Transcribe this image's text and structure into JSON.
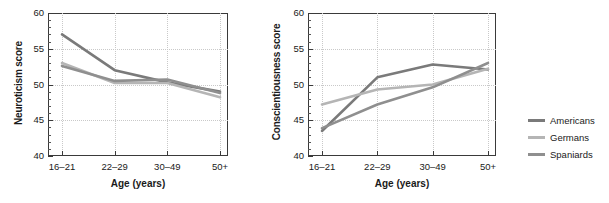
{
  "figure": {
    "background": "#ffffff",
    "legend": {
      "position": "right",
      "entries": [
        {
          "label": "Americans",
          "color": "#7a7a7a"
        },
        {
          "label": "Germans",
          "color": "#b5b5b5"
        },
        {
          "label": "Spaniards",
          "color": "#8f8f8f"
        }
      ]
    }
  },
  "chart_data": [
    {
      "id": "neuroticism",
      "type": "line",
      "title": "",
      "xlabel": "Age (years)",
      "ylabel": "Neuroticism score",
      "categories": [
        "16–21",
        "22–29",
        "30–49",
        "50+"
      ],
      "ylim": [
        40,
        60
      ],
      "yticks": [
        40,
        45,
        50,
        55,
        60
      ],
      "yticklabels": [
        "40",
        "45",
        "50",
        "55",
        "60"
      ],
      "grid": true,
      "series": [
        {
          "name": "Americans",
          "color": "#7a7a7a",
          "values": [
            57.0,
            52.0,
            50.3,
            49.0
          ]
        },
        {
          "name": "Germans",
          "color": "#b5b5b5",
          "values": [
            53.0,
            50.2,
            50.2,
            48.2
          ]
        },
        {
          "name": "Spaniards",
          "color": "#8f8f8f",
          "values": [
            52.6,
            50.5,
            50.7,
            48.8
          ]
        }
      ]
    },
    {
      "id": "conscientiousness",
      "type": "line",
      "title": "",
      "xlabel": "Age (years)",
      "ylabel": "Conscientiousness score",
      "categories": [
        "16–21",
        "22–29",
        "30–49",
        "50+"
      ],
      "ylim": [
        40,
        60
      ],
      "yticks": [
        40,
        45,
        50,
        55,
        60
      ],
      "yticklabels": [
        "40",
        "45",
        "50",
        "55",
        "60"
      ],
      "grid": true,
      "series": [
        {
          "name": "Americans",
          "color": "#7a7a7a",
          "values": [
            43.5,
            51.0,
            52.8,
            52.1
          ]
        },
        {
          "name": "Germans",
          "color": "#b5b5b5",
          "values": [
            47.2,
            49.3,
            50.0,
            52.2
          ]
        },
        {
          "name": "Spaniards",
          "color": "#8f8f8f",
          "values": [
            43.9,
            47.2,
            49.6,
            53.0
          ]
        }
      ]
    }
  ]
}
